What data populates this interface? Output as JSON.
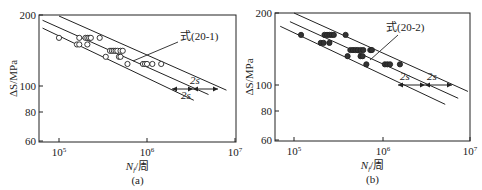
{
  "chart_data": [
    {
      "id": "a",
      "type": "scatter",
      "caption": "(a)",
      "xlabel": "N_f/周",
      "xlabel_main": "N",
      "xlabel_sub": "f",
      "xlabel_unit": "/周",
      "ylabel": "ΔS/MPa",
      "xscale": "log",
      "yscale": "log",
      "xlim": [
        60000,
        10000000
      ],
      "ylim": [
        60,
        200
      ],
      "xticks": [
        "10^5",
        "10^6",
        "10^7"
      ],
      "yticks": [
        60,
        80,
        100,
        200
      ],
      "annotation": "式(20-1)",
      "band_labels": [
        "2s",
        "2s"
      ],
      "marker": "open-circle",
      "points": [
        {
          "N": 100000,
          "S": 160
        },
        {
          "N": 170000,
          "S": 160
        },
        {
          "N": 200000,
          "S": 160
        },
        {
          "N": 210000,
          "S": 160
        },
        {
          "N": 220000,
          "S": 160
        },
        {
          "N": 230000,
          "S": 160
        },
        {
          "N": 290000,
          "S": 160
        },
        {
          "N": 160000,
          "S": 150
        },
        {
          "N": 170000,
          "S": 150
        },
        {
          "N": 210000,
          "S": 150
        },
        {
          "N": 340000,
          "S": 133
        },
        {
          "N": 380000,
          "S": 141
        },
        {
          "N": 400000,
          "S": 141
        },
        {
          "N": 420000,
          "S": 141
        },
        {
          "N": 440000,
          "S": 141
        },
        {
          "N": 460000,
          "S": 141
        },
        {
          "N": 500000,
          "S": 141
        },
        {
          "N": 530000,
          "S": 141
        },
        {
          "N": 480000,
          "S": 133
        },
        {
          "N": 500000,
          "S": 133
        },
        {
          "N": 600000,
          "S": 124
        },
        {
          "N": 900000,
          "S": 124
        },
        {
          "N": 950000,
          "S": 124
        },
        {
          "N": 1000000,
          "S": 124
        },
        {
          "N": 1150000,
          "S": 124
        },
        {
          "N": 1450000,
          "S": 124
        }
      ],
      "lines": [
        {
          "name": "upper (+2s)",
          "from": {
            "N": 100000,
            "S": 198
          },
          "to": {
            "N": 8000000,
            "S": 96
          }
        },
        {
          "name": "mean 式(20-1)",
          "from": {
            "N": 65000,
            "S": 190
          },
          "to": {
            "N": 5000000,
            "S": 92
          }
        },
        {
          "name": "lower (-2s)",
          "from": {
            "N": 65000,
            "S": 176
          },
          "to": {
            "N": 3400000,
            "S": 87
          }
        }
      ]
    },
    {
      "id": "b",
      "type": "scatter",
      "caption": "(b)",
      "xlabel": "N_f/周",
      "xlabel_main": "N",
      "xlabel_sub": "f",
      "xlabel_unit": "/周",
      "ylabel": "ΔS/MPa",
      "xscale": "log",
      "yscale": "log",
      "xlim": [
        60000,
        10000000
      ],
      "ylim": [
        60,
        200
      ],
      "xticks": [
        "10^5",
        "10^6",
        "10^7"
      ],
      "yticks": [
        60,
        80,
        100,
        200
      ],
      "annotation": "式(20-2)",
      "band_labels": [
        "2s",
        "2s"
      ],
      "marker": "filled-circle",
      "points": [
        {
          "N": 120000,
          "S": 162
        },
        {
          "N": 220000,
          "S": 162
        },
        {
          "N": 235000,
          "S": 162
        },
        {
          "N": 250000,
          "S": 162
        },
        {
          "N": 265000,
          "S": 162
        },
        {
          "N": 280000,
          "S": 162
        },
        {
          "N": 380000,
          "S": 162
        },
        {
          "N": 200000,
          "S": 150
        },
        {
          "N": 215000,
          "S": 150
        },
        {
          "N": 250000,
          "S": 150
        },
        {
          "N": 400000,
          "S": 132
        },
        {
          "N": 430000,
          "S": 140
        },
        {
          "N": 460000,
          "S": 140
        },
        {
          "N": 490000,
          "S": 140
        },
        {
          "N": 520000,
          "S": 140
        },
        {
          "N": 560000,
          "S": 140
        },
        {
          "N": 600000,
          "S": 140
        },
        {
          "N": 720000,
          "S": 140
        },
        {
          "N": 750000,
          "S": 140
        },
        {
          "N": 560000,
          "S": 132
        },
        {
          "N": 590000,
          "S": 132
        },
        {
          "N": 650000,
          "S": 122
        },
        {
          "N": 1050000,
          "S": 122
        },
        {
          "N": 1120000,
          "S": 122
        },
        {
          "N": 1200000,
          "S": 122
        },
        {
          "N": 1550000,
          "S": 122
        }
      ],
      "lines": [
        {
          "name": "upper (+2s)",
          "from": {
            "N": 100000,
            "S": 200
          },
          "to": {
            "N": 9000000,
            "S": 94
          }
        },
        {
          "name": "mean 式(20-2)",
          "from": {
            "N": 90000,
            "S": 184
          },
          "to": {
            "N": 7000000,
            "S": 88
          }
        },
        {
          "name": "lower (-2s)",
          "from": {
            "N": 70000,
            "S": 176
          },
          "to": {
            "N": 5000000,
            "S": 83
          }
        }
      ]
    }
  ]
}
